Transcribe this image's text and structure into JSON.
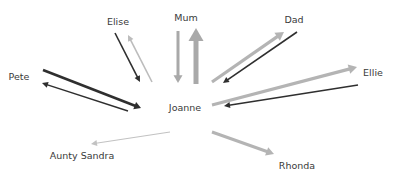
{
  "diagram": {
    "type": "relationship-network",
    "center": {
      "id": "joanne",
      "label": "Joanne",
      "x": 185,
      "y": 108
    },
    "nodes": [
      {
        "id": "mum",
        "label": "Mum",
        "x": 186,
        "y": 18
      },
      {
        "id": "elise",
        "label": "Elise",
        "x": 118,
        "y": 22
      },
      {
        "id": "dad",
        "label": "Dad",
        "x": 294,
        "y": 20
      },
      {
        "id": "pete",
        "label": "Pete",
        "x": 19,
        "y": 77
      },
      {
        "id": "ellie",
        "label": "Ellie",
        "x": 373,
        "y": 73
      },
      {
        "id": "aunty_sandra",
        "label": "Aunty Sandra",
        "x": 82,
        "y": 156
      },
      {
        "id": "rhonda",
        "label": "Rhonda",
        "x": 297,
        "y": 166
      }
    ],
    "colors": {
      "dark": "#2f2f2f",
      "mid": "#a9a9a9",
      "light": "#bcbcbc"
    },
    "edges": [
      {
        "from": "joanne",
        "to": "mum",
        "x1": 196,
        "y1": 84,
        "x2": 196,
        "y2": 28,
        "color": "#a9a9a9",
        "width": 5
      },
      {
        "from": "mum",
        "to": "joanne",
        "x1": 178,
        "y1": 31,
        "x2": 178,
        "y2": 83,
        "color": "#a9a9a9",
        "width": 3
      },
      {
        "from": "elise",
        "to": "joanne",
        "x1": 115,
        "y1": 33,
        "x2": 140,
        "y2": 82,
        "color": "#2f2f2f",
        "width": 1.6
      },
      {
        "from": "joanne",
        "to": "elise",
        "x1": 152,
        "y1": 82,
        "x2": 128,
        "y2": 35,
        "color": "#bcbcbc",
        "width": 1.6
      },
      {
        "from": "pete",
        "to": "joanne",
        "x1": 43,
        "y1": 70,
        "x2": 141,
        "y2": 108,
        "color": "#2f2f2f",
        "width": 2.6
      },
      {
        "from": "joanne",
        "to": "pete",
        "x1": 128,
        "y1": 111,
        "x2": 42,
        "y2": 83,
        "color": "#2f2f2f",
        "width": 1.4
      },
      {
        "from": "joanne",
        "to": "dad",
        "x1": 212,
        "y1": 82,
        "x2": 284,
        "y2": 32,
        "color": "#b4b4b4",
        "width": 3.2
      },
      {
        "from": "dad",
        "to": "joanne",
        "x1": 297,
        "y1": 32,
        "x2": 223,
        "y2": 83,
        "color": "#2f2f2f",
        "width": 1.6
      },
      {
        "from": "joanne",
        "to": "ellie",
        "x1": 212,
        "y1": 105,
        "x2": 357,
        "y2": 67,
        "color": "#b4b4b4",
        "width": 3.2
      },
      {
        "from": "ellie",
        "to": "joanne",
        "x1": 358,
        "y1": 85,
        "x2": 224,
        "y2": 106,
        "color": "#2f2f2f",
        "width": 1.6
      },
      {
        "from": "joanne",
        "to": "rhonda",
        "x1": 212,
        "y1": 132,
        "x2": 274,
        "y2": 154,
        "color": "#b4b4b4",
        "width": 3
      },
      {
        "from": "joanne",
        "to": "aunty_sandra",
        "x1": 170,
        "y1": 132,
        "x2": 91,
        "y2": 144,
        "color": "#c2c2c2",
        "width": 1.2
      }
    ]
  }
}
